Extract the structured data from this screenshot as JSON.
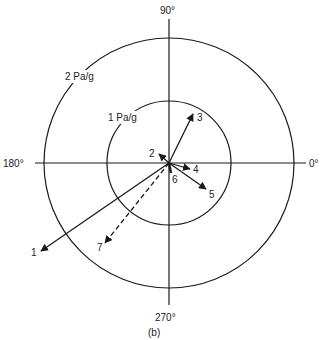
{
  "figure": {
    "caption": "(b)",
    "axis_labels": {
      "top": "90°",
      "left": "180°",
      "right": "0°",
      "bottom": "270°"
    },
    "rings": [
      {
        "label": "1 Pa/g",
        "value": 1
      },
      {
        "label": "2 Pa/g",
        "value": 2
      }
    ],
    "vectors": [
      {
        "id": "1",
        "label": "1",
        "style": "solid",
        "angle_deg": 213,
        "magnitude": 2.1
      },
      {
        "id": "2",
        "label": "2",
        "style": "solid",
        "angle_deg": 137,
        "magnitude": 0.22
      },
      {
        "id": "3",
        "label": "3",
        "style": "solid",
        "angle_deg": 64,
        "magnitude": 0.9
      },
      {
        "id": "4",
        "label": "4",
        "style": "solid",
        "angle_deg": 345,
        "magnitude": 0.35
      },
      {
        "id": "5",
        "label": "5",
        "style": "solid",
        "angle_deg": 324,
        "magnitude": 0.7
      },
      {
        "id": "6",
        "label": "6",
        "style": "solid",
        "angle_deg": 280,
        "magnitude": 0.08
      },
      {
        "id": "7",
        "label": "7",
        "style": "dashed",
        "angle_deg": 232,
        "magnitude": 1.7
      }
    ],
    "colors": {
      "line": "#1a1a1a",
      "text": "#222222",
      "background": "#ffffff"
    }
  }
}
